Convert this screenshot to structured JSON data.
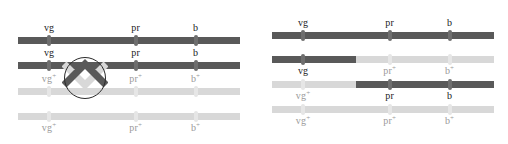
{
  "figure": {
    "colors": {
      "dark_chromatid": "#595959",
      "light_chromatid": "#d8d8d8",
      "annotation_stroke": "#2b2b2b",
      "background": "#ffffff"
    }
  },
  "loci": {
    "vg": {
      "x_percent": 14
    },
    "pr": {
      "x_percent": 53
    },
    "b": {
      "x_percent": 80
    }
  },
  "panels": [
    {
      "id": "before-crossover",
      "name": "left-panel",
      "caption": "",
      "crossover": {
        "present": true,
        "x_percent": 30,
        "between": "vg and pr",
        "marker": "circled-chiasma"
      },
      "chromatids": [
        {
          "id": "left-row-1",
          "label_position": "above",
          "segments": [
            {
              "from_percent": 0,
              "to_percent": 100,
              "shade": "dark"
            }
          ],
          "alleles": [
            {
              "gene": "vg",
              "superscript": "",
              "shade": "dark"
            },
            {
              "gene": "pr",
              "superscript": "",
              "shade": "dark"
            },
            {
              "gene": "b",
              "superscript": "",
              "shade": "dark"
            }
          ]
        },
        {
          "id": "left-row-2",
          "label_position": "above",
          "segments": [
            {
              "from_percent": 0,
              "to_percent": 100,
              "shade": "dark"
            }
          ],
          "alleles": [
            {
              "gene": "vg",
              "superscript": "",
              "shade": "dark"
            },
            {
              "gene": "pr",
              "superscript": "",
              "shade": "dark"
            },
            {
              "gene": "b",
              "superscript": "",
              "shade": "dark"
            }
          ]
        },
        {
          "id": "left-row-3",
          "label_position": "above",
          "segments": [
            {
              "from_percent": 0,
              "to_percent": 100,
              "shade": "light"
            }
          ],
          "alleles": [
            {
              "gene": "vg",
              "superscript": "+",
              "shade": "light"
            },
            {
              "gene": "pr",
              "superscript": "+",
              "shade": "light"
            },
            {
              "gene": "b",
              "superscript": "+",
              "shade": "light"
            }
          ]
        },
        {
          "id": "left-row-4",
          "label_position": "below",
          "segments": [
            {
              "from_percent": 0,
              "to_percent": 100,
              "shade": "light"
            }
          ],
          "alleles": [
            {
              "gene": "vg",
              "superscript": "+",
              "shade": "light"
            },
            {
              "gene": "pr",
              "superscript": "+",
              "shade": "light"
            },
            {
              "gene": "b",
              "superscript": "+",
              "shade": "light"
            }
          ]
        }
      ]
    },
    {
      "id": "after-crossover",
      "name": "right-panel",
      "caption": "",
      "crossover": {
        "present": false,
        "x_percent": 38
      },
      "chromatids": [
        {
          "id": "right-row-1",
          "label_position": "above",
          "segments": [
            {
              "from_percent": 0,
              "to_percent": 100,
              "shade": "dark"
            }
          ],
          "alleles": [
            {
              "gene": "vg",
              "superscript": "",
              "shade": "dark"
            },
            {
              "gene": "pr",
              "superscript": "",
              "shade": "dark"
            },
            {
              "gene": "b",
              "superscript": "",
              "shade": "dark"
            }
          ]
        },
        {
          "id": "right-row-2",
          "label_position": "below",
          "segments": [
            {
              "from_percent": 0,
              "to_percent": 38,
              "shade": "dark"
            },
            {
              "from_percent": 38,
              "to_percent": 100,
              "shade": "light"
            }
          ],
          "alleles": [
            {
              "gene": "vg",
              "superscript": "",
              "shade": "dark"
            },
            {
              "gene": "pr",
              "superscript": "+",
              "shade": "light"
            },
            {
              "gene": "b",
              "superscript": "+",
              "shade": "light"
            }
          ]
        },
        {
          "id": "right-row-3",
          "label_position": "below",
          "segments": [
            {
              "from_percent": 0,
              "to_percent": 38,
              "shade": "light"
            },
            {
              "from_percent": 38,
              "to_percent": 100,
              "shade": "dark"
            }
          ],
          "alleles": [
            {
              "gene": "vg",
              "superscript": "+",
              "shade": "light"
            },
            {
              "gene": "pr",
              "superscript": "",
              "shade": "dark"
            },
            {
              "gene": "b",
              "superscript": "",
              "shade": "dark"
            }
          ]
        },
        {
          "id": "right-row-4",
          "label_position": "below",
          "segments": [
            {
              "from_percent": 0,
              "to_percent": 100,
              "shade": "light"
            }
          ],
          "alleles": [
            {
              "gene": "vg",
              "superscript": "+",
              "shade": "light"
            },
            {
              "gene": "pr",
              "superscript": "+",
              "shade": "light"
            },
            {
              "gene": "b",
              "superscript": "+",
              "shade": "light"
            }
          ]
        }
      ]
    }
  ]
}
